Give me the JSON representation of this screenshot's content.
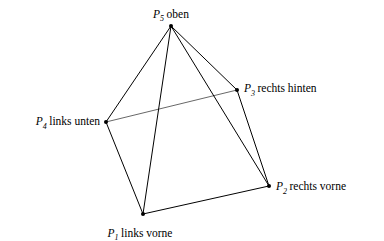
{
  "figure": {
    "name": "square-pyramid-perspective",
    "background_color": "#ffffff",
    "stroke_color": "#000000",
    "width": 384,
    "height": 241
  },
  "vertices": [
    {
      "id": "P1",
      "point_symbol": "P",
      "subscript": "1",
      "description": "links vorne",
      "x": 143,
      "y": 214,
      "label_x": 140,
      "label_y": 228,
      "label_anchor": "below-left"
    },
    {
      "id": "P2",
      "point_symbol": "P",
      "subscript": "2",
      "description": "rechts vorne",
      "x": 269,
      "y": 186,
      "label_x": 276,
      "label_y": 187,
      "label_anchor": "left"
    },
    {
      "id": "P3",
      "point_symbol": "P",
      "subscript": "3",
      "description": "rechts hinten",
      "x": 237,
      "y": 90,
      "label_x": 244,
      "label_y": 89,
      "label_anchor": "left"
    },
    {
      "id": "P4",
      "point_symbol": "P",
      "subscript": "4",
      "description": "links unten",
      "x": 106,
      "y": 122,
      "label_x": 100,
      "label_y": 122,
      "label_anchor": "right"
    },
    {
      "id": "P5",
      "point_symbol": "P",
      "subscript": "5",
      "description": "oben",
      "x": 171,
      "y": 26,
      "label_x": 171,
      "label_y": 20,
      "label_anchor": "above"
    }
  ],
  "edges": [
    {
      "from": "P5",
      "to": "P4",
      "style": "solid",
      "weight": 1.0,
      "kind": "lateral"
    },
    {
      "from": "P5",
      "to": "P1",
      "style": "solid",
      "weight": 1.0,
      "kind": "lateral"
    },
    {
      "from": "P5",
      "to": "P3",
      "style": "solid",
      "weight": 1.0,
      "kind": "lateral"
    },
    {
      "from": "P5",
      "to": "P2",
      "style": "solid",
      "weight": 1.0,
      "kind": "lateral"
    },
    {
      "from": "P4",
      "to": "P1",
      "style": "solid",
      "weight": 1.0,
      "kind": "base"
    },
    {
      "from": "P1",
      "to": "P2",
      "style": "solid",
      "weight": 1.0,
      "kind": "base"
    },
    {
      "from": "P2",
      "to": "P3",
      "style": "solid",
      "weight": 1.0,
      "kind": "base"
    },
    {
      "from": "P4",
      "to": "P3",
      "style": "solid",
      "weight": 0.6,
      "kind": "base-back"
    }
  ],
  "vertex_dot_radius": 2.0
}
